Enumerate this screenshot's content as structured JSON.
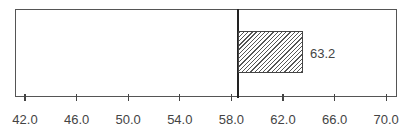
{
  "chart_data": {
    "type": "bar",
    "orientation": "horizontal",
    "title": "",
    "xlabel": "",
    "ylabel": "",
    "categories": [
      ""
    ],
    "values": [
      63.2
    ],
    "data_labels": [
      "63.2"
    ],
    "reference_line": 58.5,
    "bar_baseline": 58.5,
    "xlim": [
      40.8,
      72.0
    ],
    "xticks": [
      42.0,
      46.0,
      50.0,
      54.0,
      58.0,
      62.0,
      66.0,
      70.0
    ],
    "xtick_labels": [
      "42.0",
      "46.0",
      "50.0",
      "54.0",
      "58.0",
      "62.0",
      "66.0",
      "70.0"
    ],
    "grid": false,
    "legend": null,
    "bar_fill": "diagonal-hatch",
    "colors": {
      "axis": "#555555",
      "bar_edge": "#444444",
      "hatch": "#555555",
      "text": "#444444"
    }
  }
}
